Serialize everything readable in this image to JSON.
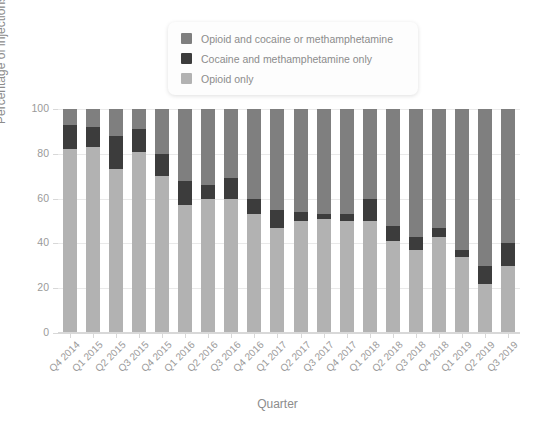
{
  "chart_data": {
    "type": "bar",
    "stacked": true,
    "stack_mode": "percent",
    "title": "",
    "xlabel": "Quarter",
    "ylabel": "Percentage of injections",
    "ylim": [
      0,
      100
    ],
    "yticks": [
      0,
      20,
      40,
      60,
      80,
      100
    ],
    "grid": true,
    "legend_position": "top-center",
    "categories": [
      "Q4 2014",
      "Q1 2015",
      "Q2 2015",
      "Q3 2015",
      "Q4 2015",
      "Q1 2016",
      "Q2 2016",
      "Q3 2016",
      "Q4 2016",
      "Q1 2017",
      "Q2 2017",
      "Q3 2017",
      "Q4 2017",
      "Q1 2018",
      "Q2 2018",
      "Q3 2018",
      "Q4 2018",
      "Q1 2019",
      "Q2 2019",
      "Q3 2019"
    ],
    "series": [
      {
        "name": "Opioid only",
        "color": "#b2b2b2",
        "values": [
          82,
          83,
          73,
          81,
          70,
          57,
          60,
          60,
          53,
          47,
          50,
          51,
          50,
          50,
          41,
          37,
          43,
          34,
          22,
          30
        ]
      },
      {
        "name": "Cocaine and methamphetamine only",
        "color": "#3c3c3c",
        "values": [
          11,
          9,
          15,
          10,
          10,
          11,
          6,
          9,
          7,
          8,
          4,
          2,
          3,
          10,
          7,
          6,
          4,
          3,
          8,
          10
        ]
      },
      {
        "name": "Opioid and cocaine or methamphetamine",
        "color": "#7f7f7f",
        "values": [
          7,
          8,
          12,
          9,
          20,
          32,
          34,
          31,
          40,
          45,
          46,
          47,
          47,
          40,
          52,
          57,
          53,
          63,
          70,
          60
        ]
      }
    ]
  },
  "legend": {
    "items": [
      {
        "label": "Opioid and cocaine or methamphetamine",
        "color": "#7f7f7f"
      },
      {
        "label": "Cocaine and methamphetamine only",
        "color": "#3c3c3c"
      },
      {
        "label": "Opioid only",
        "color": "#b2b2b2"
      }
    ]
  },
  "axes": {
    "y_title": "Percentage of injections",
    "x_title": "Quarter",
    "y_tick_labels": [
      "0",
      "20",
      "40",
      "60",
      "80",
      "100"
    ]
  }
}
